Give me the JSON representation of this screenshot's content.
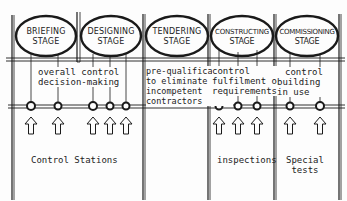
{
  "stages": [
    {
      "name": "BRIEFING",
      "sub": "STAGE"
    },
    {
      "name": "DESIGNING",
      "sub": "STAGE"
    },
    {
      "name": "TENDERING",
      "sub": "STAGE"
    },
    {
      "name": "CONSTRUCTING",
      "sub": "STAGE"
    },
    {
      "name": "COMMISSIONING",
      "sub": "STAGE"
    }
  ],
  "descriptions": {
    "briefing_designing": [
      "overall control",
      "decision-making"
    ],
    "tendering": [
      "pre-qualification",
      "to eliminate",
      "incompetent",
      "contractors"
    ],
    "constructing": [
      "control",
      "fulfilment of",
      "requirements"
    ],
    "commissioning": [
      "control",
      "building",
      "in use"
    ]
  },
  "labels": {
    "control_stations": "Control Stations",
    "inspections": "inspections",
    "special_tests": [
      "Special",
      "tests"
    ]
  },
  "control_points": {
    "briefing_designing": 5,
    "constructing": 3,
    "commissioning": 2
  },
  "colors": {
    "ink": "#1a1a1a",
    "paper": "#fdfdfd"
  }
}
